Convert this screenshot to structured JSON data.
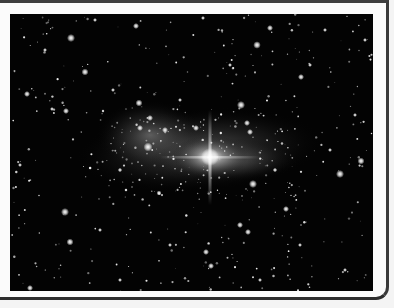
{
  "panel": {
    "image": {
      "subject": "Galaxy / star cluster in a dense starfield",
      "alt": "Grayscale astronomical photograph of a bright galaxy core surrounded by a starfield",
      "palette": {
        "sky": "#030303",
        "core": "#ffffff",
        "halo": "#bdbdbd",
        "frame": "#3a3a3a",
        "background": "#fbfbfb"
      }
    }
  }
}
